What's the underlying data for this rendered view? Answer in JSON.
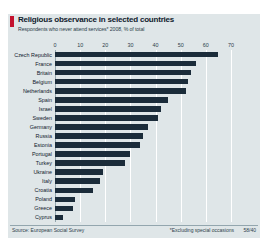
{
  "header": {
    "title": "Religious observance in selected countries",
    "subtitle": "Respondents who never attend services* 2008, % of total",
    "accent_color": "#c4122e"
  },
  "footer": {
    "source": "Source: European Social Survey",
    "footnote": "*Excluding special occasions",
    "figure_id": "58/40"
  },
  "style": {
    "bar_color": "#1b2c3a",
    "panel_color": "#dfe6e8",
    "gridline_color": "#ffffff",
    "axis_color": "#93a6ae"
  },
  "chart_data": {
    "type": "bar",
    "orientation": "horizontal",
    "title": "Religious observance in selected countries",
    "subtitle": "Respondents who never attend services* 2008, % of total",
    "xlabel": "",
    "ylabel": "",
    "xlim": [
      0,
      70
    ],
    "xticks": [
      0,
      10,
      20,
      30,
      40,
      50,
      60,
      70
    ],
    "grid": true,
    "legend": false,
    "categories": [
      "Czech Republic",
      "France",
      "Britain",
      "Belgium",
      "Netherlands",
      "Spain",
      "Israel",
      "Sweden",
      "Germany",
      "Russia",
      "Estonia",
      "Portugal",
      "Turkey",
      "Ukraine",
      "Italy",
      "Croatia",
      "Poland",
      "Greece",
      "Cyprus"
    ],
    "values": [
      65,
      56,
      54,
      53,
      52,
      45,
      42,
      41,
      37,
      35,
      34,
      30,
      28,
      19,
      18,
      15,
      8,
      7,
      3
    ]
  }
}
